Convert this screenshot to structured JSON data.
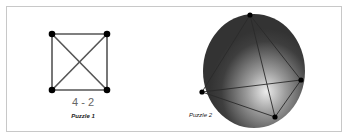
{
  "puzzle1": {
    "label": "4 - 2",
    "caption": "Puzzle 1",
    "vertices": 4
  },
  "puzzle2": {
    "caption": "Puzzle 2"
  },
  "colors": {
    "edge": "#555555",
    "vertex": "#000000",
    "sphere_dark": "#333333",
    "sphere_light": "#e6e6e6",
    "border": "#c8c8c8"
  }
}
